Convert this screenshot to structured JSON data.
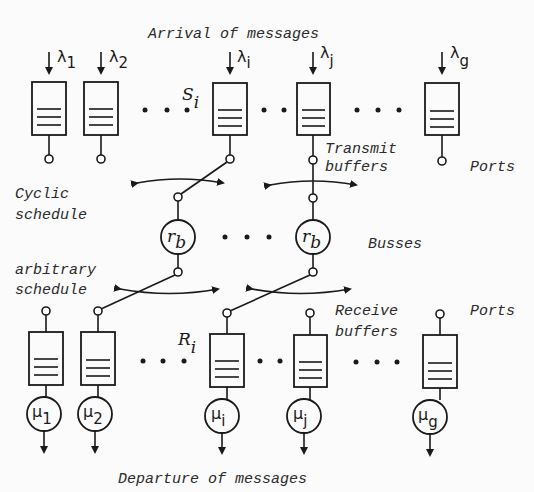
{
  "labels": {
    "arrival": "Arrival of messages",
    "departure": "Departure of messages",
    "cyclic_1": "Cyclic",
    "cyclic_2": "schedule",
    "arbitrary_1": "arbitrary",
    "arbitrary_2": "schedule",
    "transmit_1": "Transmit",
    "transmit_2": "buffers",
    "receive_1": "Receive",
    "receive_2": "buffers",
    "ports_top": "Ports",
    "ports_bottom": "Ports",
    "busses": "Busses",
    "s_i": "S",
    "s_i_sub": "i",
    "r_i": "R",
    "r_i_sub": "i"
  },
  "arrival_rates": [
    {
      "sym": "λ",
      "sub": "1"
    },
    {
      "sym": "λ",
      "sub": "2"
    },
    {
      "sym": "λ",
      "sub": "i"
    },
    {
      "sym": "λ",
      "sub": "j"
    },
    {
      "sym": "λ",
      "sub": "g"
    }
  ],
  "service_rates": [
    {
      "sym": "μ",
      "sub": "1"
    },
    {
      "sym": "μ",
      "sub": "2"
    },
    {
      "sym": "μ",
      "sub": "i"
    },
    {
      "sym": "μ",
      "sub": "j"
    },
    {
      "sym": "μ",
      "sub": "g"
    }
  ],
  "busses": [
    {
      "sym": "r",
      "sub": "b"
    },
    {
      "sym": "r",
      "sub": "b"
    }
  ],
  "colors": {
    "ink": "#1a1a1a",
    "paper": "#fbfbfb"
  }
}
